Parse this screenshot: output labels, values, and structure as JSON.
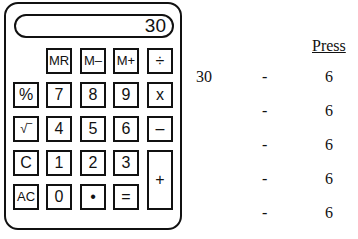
{
  "calculator": {
    "display": "30",
    "keys": [
      {
        "label": "MR",
        "col": 1,
        "row": 0
      },
      {
        "label": "M–",
        "col": 2,
        "row": 0
      },
      {
        "label": "M+",
        "col": 3,
        "row": 0
      },
      {
        "label": "÷",
        "col": 4,
        "row": 0
      },
      {
        "label": "%",
        "col": 0,
        "row": 1
      },
      {
        "label": "7",
        "col": 1,
        "row": 1
      },
      {
        "label": "8",
        "col": 2,
        "row": 1
      },
      {
        "label": "9",
        "col": 3,
        "row": 1
      },
      {
        "label": "x",
        "col": 4,
        "row": 1
      },
      {
        "label": "√‾",
        "col": 0,
        "row": 2
      },
      {
        "label": "4",
        "col": 1,
        "row": 2
      },
      {
        "label": "5",
        "col": 2,
        "row": 2
      },
      {
        "label": "6",
        "col": 3,
        "row": 2
      },
      {
        "label": "–",
        "col": 4,
        "row": 2
      },
      {
        "label": "C",
        "col": 0,
        "row": 3
      },
      {
        "label": "1",
        "col": 1,
        "row": 3
      },
      {
        "label": "2",
        "col": 2,
        "row": 3
      },
      {
        "label": "3",
        "col": 3,
        "row": 3
      },
      {
        "label": "+",
        "col": 4,
        "row": 3,
        "tall": true
      },
      {
        "label": "AC",
        "col": 0,
        "row": 4
      },
      {
        "label": "0",
        "col": 1,
        "row": 4
      },
      {
        "label": "•",
        "col": 2,
        "row": 4
      },
      {
        "label": "=",
        "col": 3,
        "row": 4
      }
    ]
  },
  "sequence": {
    "header": "Press",
    "start": "30",
    "rows": [
      {
        "op": "-",
        "value": "6"
      },
      {
        "op": "-",
        "value": "6"
      },
      {
        "op": "-",
        "value": "6"
      },
      {
        "op": "-",
        "value": "6"
      },
      {
        "op": "-",
        "value": "6"
      }
    ]
  }
}
